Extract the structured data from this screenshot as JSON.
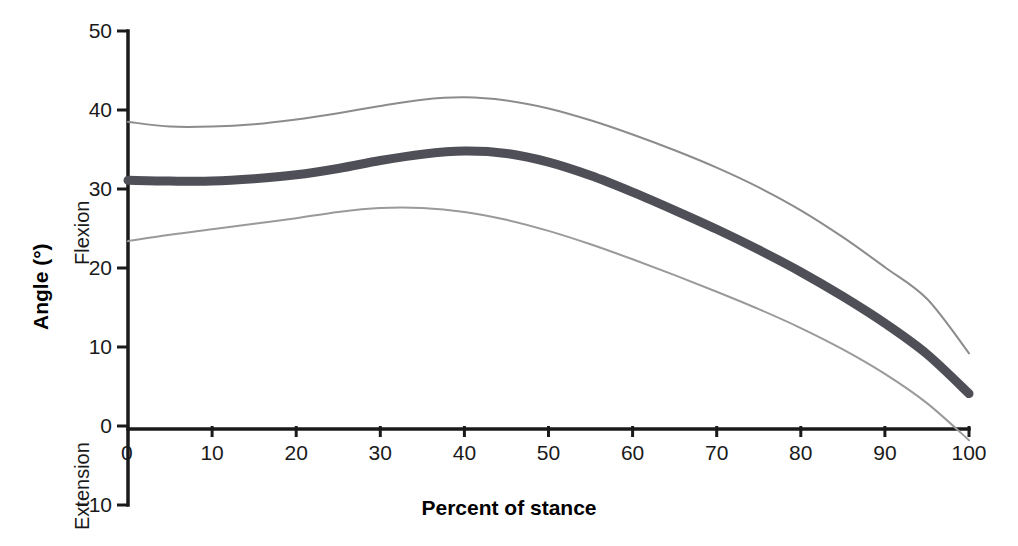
{
  "chart_data": {
    "type": "line",
    "title": "",
    "xlabel": "Percent of stance",
    "ylabel": "Angle (°)",
    "ylabel_top_side": "Flexion",
    "ylabel_bottom_side": "Extension",
    "xlim": [
      0,
      100
    ],
    "ylim": [
      -10,
      50
    ],
    "grid": false,
    "legend": "none",
    "xticks": [
      0,
      10,
      20,
      30,
      40,
      50,
      60,
      70,
      80,
      90,
      100
    ],
    "xtick_labels": [
      "0",
      "10",
      "20",
      "30",
      "40",
      "50",
      "60",
      "70",
      "80",
      "90",
      "100"
    ],
    "yticks": [
      -10,
      0,
      10,
      20,
      30,
      40,
      50
    ],
    "ytick_labels": [
      "−10",
      "0",
      "10",
      "20",
      "30",
      "40",
      "50"
    ],
    "x": [
      0,
      5,
      10,
      15,
      20,
      25,
      30,
      35,
      40,
      45,
      50,
      55,
      60,
      65,
      70,
      75,
      80,
      85,
      90,
      95,
      100
    ],
    "series": [
      {
        "name": "Upper band (+1 SD)",
        "role": "upper-band",
        "color": "#8c8c8c",
        "width": 2,
        "values": [
          38.5,
          37.9,
          37.9,
          38.2,
          38.8,
          39.6,
          40.5,
          41.3,
          41.6,
          41.2,
          40.2,
          38.7,
          36.9,
          34.9,
          32.7,
          30.2,
          27.3,
          23.9,
          20.1,
          16.1,
          9.2
        ]
      },
      {
        "name": "Mean",
        "role": "mean",
        "color": "#4f4f57",
        "width": 9,
        "values": [
          31.1,
          31.0,
          31.0,
          31.3,
          31.8,
          32.6,
          33.6,
          34.4,
          34.8,
          34.5,
          33.4,
          31.7,
          29.6,
          27.3,
          24.9,
          22.3,
          19.5,
          16.4,
          13.0,
          9.1,
          4.1
        ]
      },
      {
        "name": "Lower band (−1 SD)",
        "role": "lower-band",
        "color": "#9a9a9a",
        "width": 2,
        "values": [
          23.4,
          24.2,
          24.9,
          25.6,
          26.3,
          27.1,
          27.6,
          27.6,
          27.1,
          26.1,
          24.7,
          23.0,
          21.1,
          19.1,
          17.0,
          14.8,
          12.4,
          9.7,
          6.6,
          2.9,
          -1.8
        ]
      }
    ]
  },
  "axis": {
    "spine_color": "#1a1a1a"
  }
}
